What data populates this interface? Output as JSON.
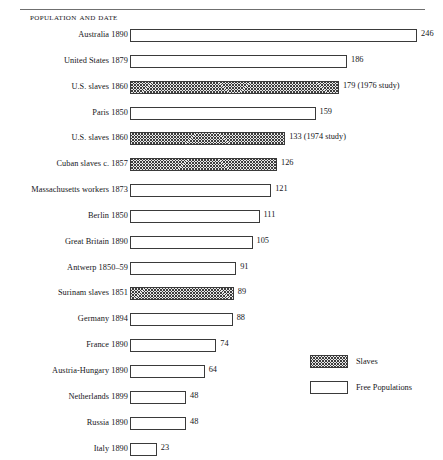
{
  "chart_data": {
    "type": "bar",
    "orientation": "horizontal",
    "title": "Population and Date",
    "xlabel": "",
    "ylabel": "",
    "grid": false,
    "xlim": [
      0,
      246
    ],
    "legend_position": "bottom-right",
    "categories": [
      "Australia 1890",
      "United States 1879",
      "U.S. slaves 1860",
      "Paris 1850",
      "U.S. slaves 1860",
      "Cuban slaves c. 1857",
      "Massachusetts workers 1873",
      "Berlin 1850",
      "Great Britain 1890",
      "Antwerp 1850–59",
      "Surinam slaves 1851",
      "Germany 1894",
      "France 1890",
      "Austria-Hungary 1890",
      "Netherlands 1899",
      "Russia 1890",
      "Italy 1890"
    ],
    "values": [
      246,
      186,
      179,
      159,
      133,
      126,
      121,
      111,
      105,
      91,
      89,
      88,
      74,
      64,
      48,
      48,
      23
    ],
    "data_labels": [
      "246",
      "186",
      "179 (1976 study)",
      "159",
      "133 (1974 study)",
      "126",
      "121",
      "111",
      "105",
      "91",
      "89",
      "88",
      "74",
      "64",
      "48",
      "48",
      "23"
    ],
    "series_group": [
      "free",
      "free",
      "slaves",
      "free",
      "slaves",
      "slaves",
      "free",
      "free",
      "free",
      "free",
      "slaves",
      "free",
      "free",
      "free",
      "free",
      "free",
      "free"
    ],
    "legend": [
      {
        "key": "slaves",
        "label": "Slaves",
        "pattern": "hatched"
      },
      {
        "key": "free",
        "label": "Free Populations",
        "pattern": "plain"
      }
    ],
    "colors": {
      "bar_outline": "#3a3a3a",
      "bar_fill_free": "#ffffff",
      "bar_fill_slaves": "#e9e9e9",
      "hatch_color": "#3d3d3d",
      "text": "#16161a",
      "rule": "#6f6f6f"
    }
  },
  "rows": [
    {
      "label": "Australia 1890",
      "value": 246,
      "data_label": "246",
      "group": "free"
    },
    {
      "label": "United States 1879",
      "value": 186,
      "data_label": "186",
      "group": "free"
    },
    {
      "label": "U.S. slaves 1860",
      "value": 179,
      "data_label": "179 (1976 study)",
      "group": "slaves"
    },
    {
      "label": "Paris 1850",
      "value": 159,
      "data_label": "159",
      "group": "free"
    },
    {
      "label": "U.S. slaves 1860",
      "value": 133,
      "data_label": "133 (1974 study)",
      "group": "slaves"
    },
    {
      "label": "Cuban slaves c. 1857",
      "value": 126,
      "data_label": "126",
      "group": "slaves"
    },
    {
      "label": "Massachusetts workers 1873",
      "value": 121,
      "data_label": "121",
      "group": "free"
    },
    {
      "label": "Berlin 1850",
      "value": 111,
      "data_label": "111",
      "group": "free"
    },
    {
      "label": "Great Britain 1890",
      "value": 105,
      "data_label": "105",
      "group": "free"
    },
    {
      "label": "Antwerp 1850–59",
      "value": 91,
      "data_label": "91",
      "group": "free"
    },
    {
      "label": "Surinam slaves 1851",
      "value": 89,
      "data_label": "89",
      "group": "slaves"
    },
    {
      "label": "Germany 1894",
      "value": 88,
      "data_label": "88",
      "group": "free"
    },
    {
      "label": "France 1890",
      "value": 74,
      "data_label": "74",
      "group": "free"
    },
    {
      "label": "Austria-Hungary 1890",
      "value": 64,
      "data_label": "64",
      "group": "free"
    },
    {
      "label": "Netherlands 1899",
      "value": 48,
      "data_label": "48",
      "group": "free"
    },
    {
      "label": "Russia 1890",
      "value": 48,
      "data_label": "48",
      "group": "free"
    },
    {
      "label": "Italy 1890",
      "value": 23,
      "data_label": "23",
      "group": "free"
    }
  ],
  "legend": {
    "items": [
      {
        "label": "Slaves",
        "group": "slaves"
      },
      {
        "label": "Free Populations",
        "group": "free"
      }
    ]
  },
  "header": {
    "title": "Population and Date"
  },
  "scale": {
    "px_per_unit": 1.167,
    "bar_origin_x": 130
  }
}
